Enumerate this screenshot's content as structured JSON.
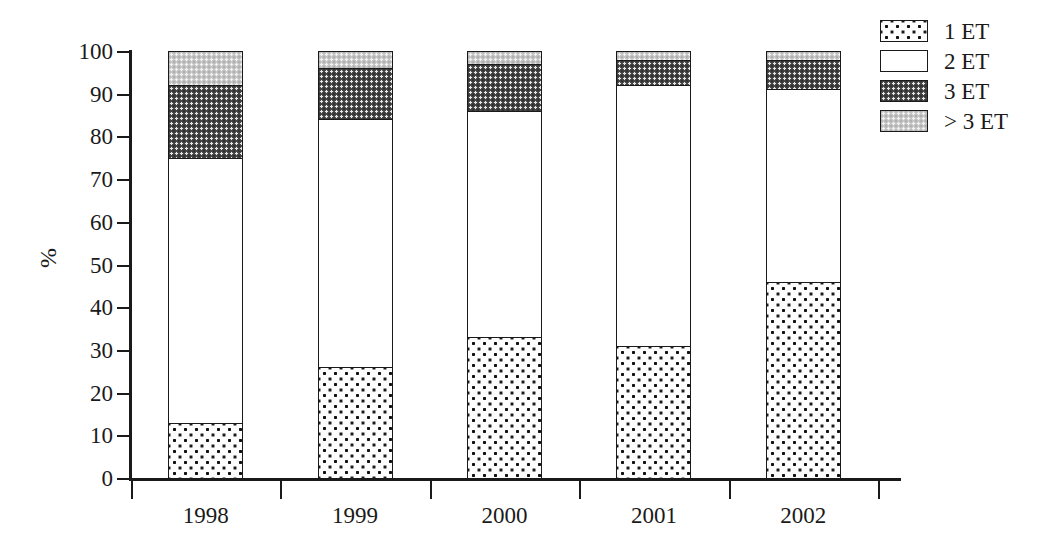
{
  "chart_data": {
    "type": "bar",
    "stacked": true,
    "title": "",
    "xlabel": "",
    "ylabel": "%",
    "ylim": [
      0,
      100
    ],
    "yticks": [
      0,
      10,
      20,
      30,
      40,
      50,
      60,
      70,
      80,
      90,
      100
    ],
    "ytick_labels": [
      "0",
      "10",
      "20",
      "30",
      "40",
      "50",
      "60",
      "70",
      "80",
      "90",
      "100"
    ],
    "grid": false,
    "legend_position": "top-right",
    "categories": [
      "1998",
      "1999",
      "2000",
      "2001",
      "2002"
    ],
    "series": [
      {
        "name": "1 ET",
        "values": [
          13,
          26,
          33,
          31,
          46
        ],
        "fill": "dotted-on-white",
        "color": "#fdfdfd"
      },
      {
        "name": "2 ET",
        "values": [
          62,
          58,
          53,
          61,
          45
        ],
        "fill": "solid-white",
        "color": "#ffffff"
      },
      {
        "name": "3 ET",
        "values": [
          17,
          12,
          11,
          6,
          7
        ],
        "fill": "dotted-dark",
        "color": "#4a4a4a"
      },
      {
        "name": "> 3 ET",
        "values": [
          8,
          4,
          3,
          2,
          2
        ],
        "fill": "dotted-light",
        "color": "#c9c9c9"
      }
    ],
    "cumulative_tops": [
      [
        13,
        75,
        92,
        100
      ],
      [
        26,
        84,
        96,
        100
      ],
      [
        33,
        86,
        97,
        100
      ],
      [
        31,
        92,
        98,
        100
      ],
      [
        46,
        91,
        98,
        100
      ]
    ]
  },
  "legend": {
    "items": [
      {
        "label": "1 ET"
      },
      {
        "label": "2 ET"
      },
      {
        "label": "3 ET"
      },
      {
        "label": "> 3 ET"
      }
    ]
  },
  "axes": {
    "y_title": "%"
  }
}
